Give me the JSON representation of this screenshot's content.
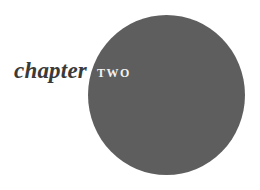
{
  "heading": {
    "label": "chapter",
    "number": "TWO"
  },
  "colors": {
    "circle": "#5e5e5e",
    "label_text": "#3a3a3a",
    "number_text": "#f2f2f2",
    "background": "#ffffff"
  }
}
